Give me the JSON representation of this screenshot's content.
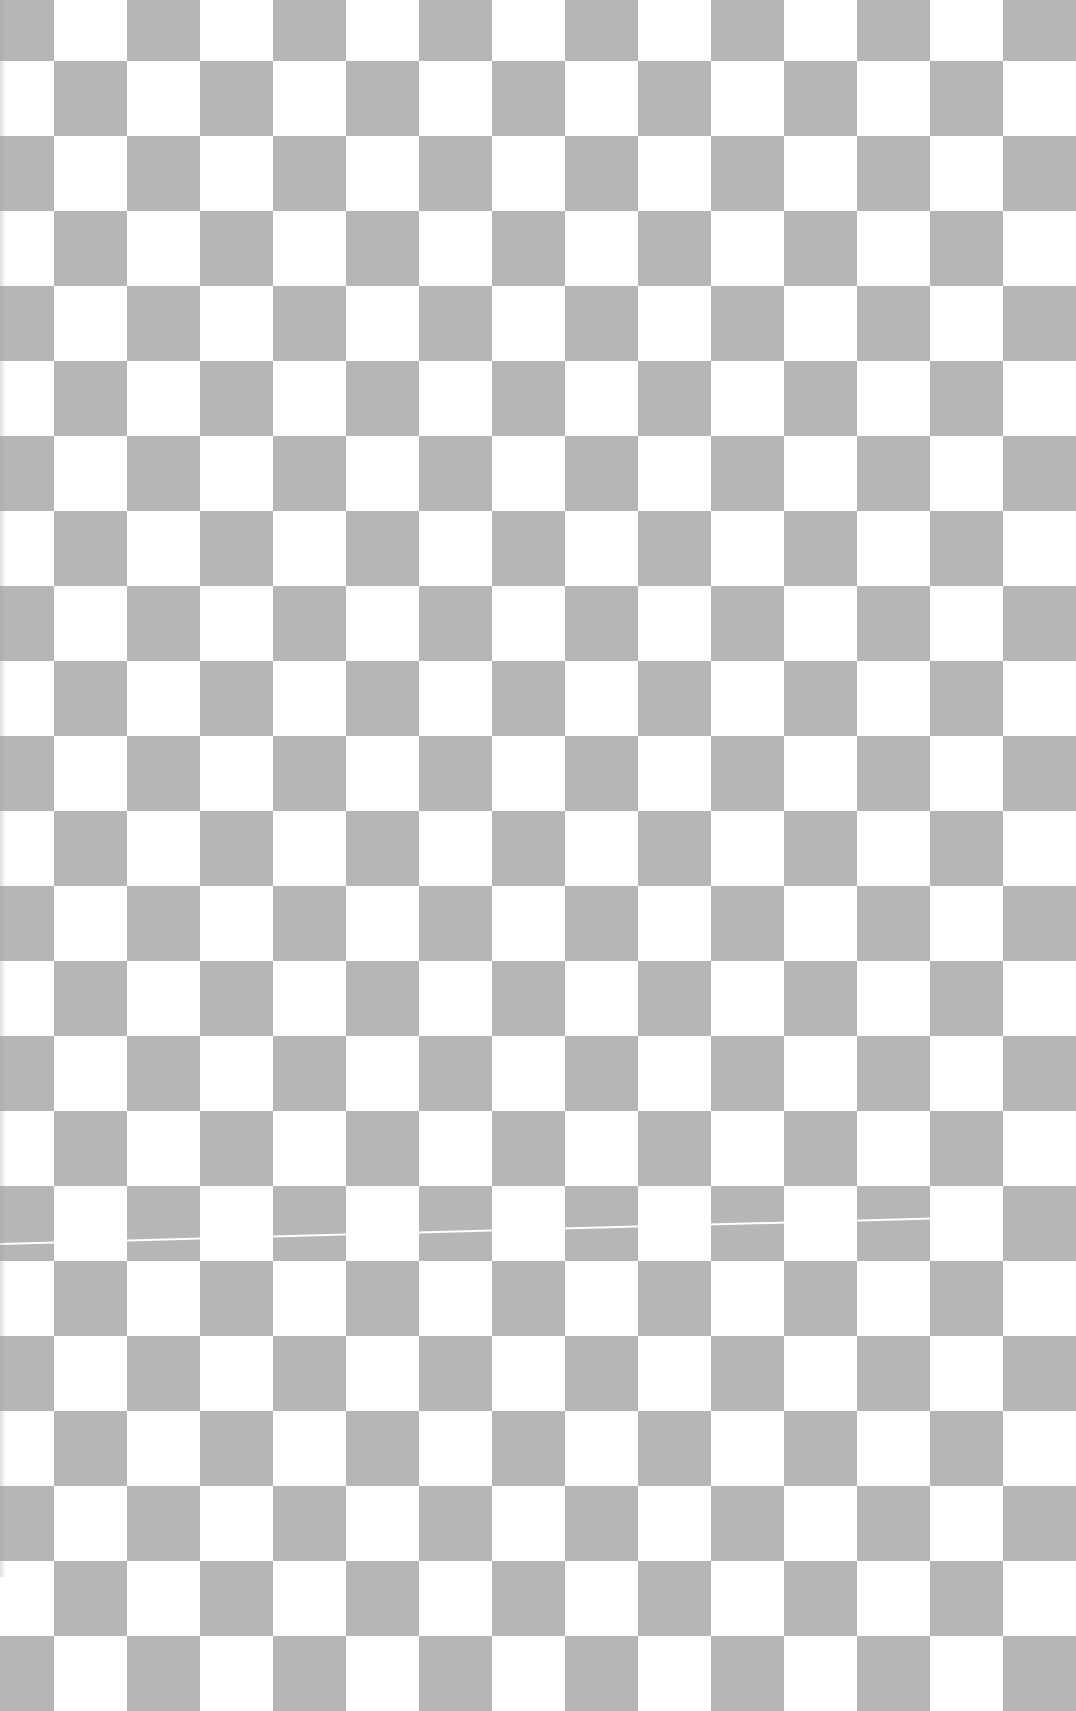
{
  "image": {
    "description": "Grey and white checkerboard pattern",
    "colors": {
      "light": "#ffffff",
      "dark": "#b6b6b6"
    },
    "grid": {
      "origin_x": 54,
      "origin_y": 61,
      "cell_width": 73,
      "cell_height": 75,
      "first_dark_parity": 1
    },
    "seam": {
      "y_left": 1243,
      "y_right": 1217
    }
  }
}
